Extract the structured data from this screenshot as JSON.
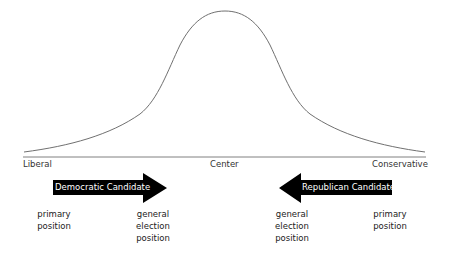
{
  "diagram": {
    "axis": {
      "left_label": "Liberal",
      "center_label": "Center",
      "right_label": "Conservative"
    },
    "arrows": [
      {
        "label": "Democratic Candidate",
        "direction": "right",
        "color": "#000000"
      },
      {
        "label": "Republican Candidate",
        "direction": "left",
        "color": "#000000"
      }
    ],
    "positions": {
      "dem_primary": "primary\nposition",
      "dem_general": "general\nelection\nposition",
      "rep_general": "general\nelection\nposition",
      "rep_primary": "primary\nposition"
    },
    "curve": {
      "type": "bell",
      "stroke": "#666666"
    }
  }
}
